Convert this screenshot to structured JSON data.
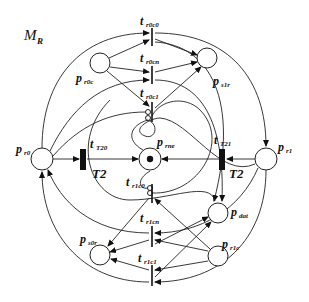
{
  "diagram": {
    "title": {
      "main": "M",
      "sub": "R"
    },
    "places": [
      {
        "id": "p_r0c",
        "label": "p",
        "sub": "r0c",
        "cx": 100,
        "cy": 63
      },
      {
        "id": "p_s1r",
        "label": "p",
        "sub": "s1r",
        "cx": 207,
        "cy": 58
      },
      {
        "id": "p_r0",
        "label": "p",
        "sub": "r0",
        "cx": 42,
        "cy": 159
      },
      {
        "id": "p_rne",
        "label": "p",
        "sub": "rne",
        "cx": 150,
        "cy": 159,
        "token": true
      },
      {
        "id": "p_r1",
        "label": "p",
        "sub": "r1",
        "cx": 266,
        "cy": 159
      },
      {
        "id": "p_dat",
        "label": "p",
        "sub": "dat",
        "cx": 218,
        "cy": 213
      },
      {
        "id": "p_s0r",
        "label": "p",
        "sub": "s0r",
        "cx": 100,
        "cy": 255
      },
      {
        "id": "p_r1c",
        "label": "p",
        "sub": "r1c",
        "cx": 218,
        "cy": 256
      }
    ],
    "transitions": [
      {
        "id": "t_r0c0",
        "label": "t",
        "sub": "r0c0"
      },
      {
        "id": "t_r0cn",
        "label": "t",
        "sub": "r0cn"
      },
      {
        "id": "t_r0c1",
        "label": "t",
        "sub": "r0c1"
      },
      {
        "id": "t_T20",
        "label": "t",
        "sub": "T20",
        "timed": "T2"
      },
      {
        "id": "t_T21",
        "label": "t",
        "sub": "T21",
        "timed": "T2"
      },
      {
        "id": "t_r1c0",
        "label": "t",
        "sub": "r1c0"
      },
      {
        "id": "t_r1cn",
        "label": "t",
        "sub": "r1cn"
      },
      {
        "id": "t_r1c1",
        "label": "t",
        "sub": "r1c1"
      }
    ]
  }
}
